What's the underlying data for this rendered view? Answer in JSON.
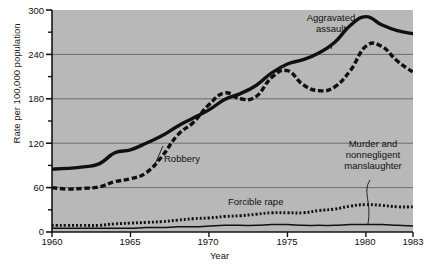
{
  "chart_data": {
    "type": "line",
    "title": "",
    "xlabel": "Year",
    "ylabel": "Rate per 100,000 population",
    "xlim": [
      1960,
      1983
    ],
    "ylim": [
      0,
      300
    ],
    "ytick_labels": [
      "0",
      "60",
      "120",
      "180",
      "240",
      "300"
    ],
    "ytick_values": [
      0,
      60,
      120,
      180,
      240,
      300
    ],
    "yminor_values": [
      30,
      90,
      150,
      210,
      270
    ],
    "xtick_labels": [
      "1960",
      "1965",
      "1970",
      "1975",
      "1980",
      "1983"
    ],
    "xtick_values": [
      1960,
      1965,
      1970,
      1975,
      1980,
      1983
    ],
    "grid": "horizontal-major",
    "legend": "inline-annotations",
    "plot_background": "#b8b8b8",
    "line_color": "#141414",
    "x": [
      1960,
      1961,
      1962,
      1963,
      1964,
      1965,
      1966,
      1967,
      1968,
      1969,
      1970,
      1971,
      1972,
      1973,
      1974,
      1975,
      1976,
      1977,
      1978,
      1979,
      1980,
      1981,
      1982,
      1983
    ],
    "series": [
      {
        "name": "Aggravated assault",
        "style": "solid-thick",
        "values": [
          85,
          86,
          88,
          92,
          107,
          111,
          120,
          130,
          143,
          154,
          165,
          179,
          187,
          198,
          215,
          227,
          233,
          242,
          256,
          279,
          291,
          280,
          272,
          268
        ]
      },
      {
        "name": "Robbery",
        "style": "dashed-thick",
        "values": [
          60,
          58,
          59,
          61,
          68,
          72,
          80,
          102,
          131,
          148,
          172,
          188,
          180,
          183,
          209,
          218,
          199,
          191,
          196,
          218,
          251,
          251,
          231,
          216
        ]
      },
      {
        "name": "Forcible rape",
        "style": "dotted",
        "values": [
          9,
          9,
          9,
          9,
          11,
          12,
          13,
          14,
          16,
          18,
          19,
          21,
          22,
          24,
          26,
          26,
          26,
          29,
          31,
          35,
          37,
          36,
          34,
          34
        ]
      },
      {
        "name": "Murder and nonnegligent manslaughter",
        "style": "solid-thin",
        "values": [
          5,
          5,
          5,
          5,
          5,
          5,
          6,
          6,
          7,
          7,
          8,
          9,
          9,
          9,
          10,
          10,
          9,
          9,
          9,
          10,
          10,
          10,
          9,
          8
        ]
      }
    ],
    "annotations": [
      {
        "text_lines": [
          "Aggravated",
          "assault"
        ],
        "target_series": "Aggravated assault"
      },
      {
        "text_lines": [
          "Robbery"
        ],
        "target_series": "Robbery"
      },
      {
        "text_lines": [
          "Forcible rape"
        ],
        "target_series": "Forcible rape"
      },
      {
        "text_lines": [
          "Murder and",
          "nonnegligent",
          "manslaughter"
        ],
        "target_series": "Murder and nonnegligent manslaughter"
      }
    ]
  },
  "labels": {
    "y_axis_title": "Rate per 100,000 population",
    "x_axis_title": "Year",
    "yticks": [
      "300",
      "240",
      "180",
      "120",
      "60",
      "0"
    ],
    "xticks": [
      "1960",
      "1965",
      "1970",
      "1975",
      "1980",
      "1983"
    ],
    "ann_aggravated_1": "Aggravated",
    "ann_aggravated_2": "assault",
    "ann_robbery": "Robbery",
    "ann_rape": "Forcible rape",
    "ann_murder_1": "Murder and",
    "ann_murder_2": "nonnegligent",
    "ann_murder_3": "manslaughter"
  }
}
